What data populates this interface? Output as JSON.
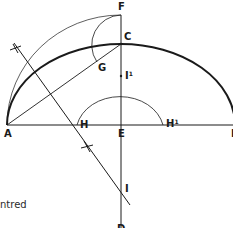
{
  "diagram": {
    "colors": {
      "stroke": "#1a1a1a",
      "background": "#ffffff"
    },
    "points": {
      "A": {
        "label": "A",
        "x": 7,
        "y": 125
      },
      "E": {
        "label": "E",
        "x": 121,
        "y": 125
      },
      "B": {
        "label": "B",
        "x": 233,
        "y": 125
      },
      "C": {
        "label": "C",
        "x": 121,
        "y": 44
      },
      "F": {
        "label": "F",
        "x": 121,
        "y": 15
      },
      "G": {
        "label": "G",
        "x": 97,
        "y": 62
      },
      "H": {
        "label": "H",
        "x": 77,
        "y": 125
      },
      "H1": {
        "label": "H",
        "sup": "1",
        "x": 163,
        "y": 125
      },
      "I": {
        "label": "I",
        "x": 121,
        "y": 190
      },
      "I1": {
        "label": "I",
        "sup": "1",
        "x": 121,
        "y": 76
      },
      "D": {
        "label": "D",
        "x": 121,
        "y": 228
      }
    },
    "caption_fragment": "ntred"
  }
}
